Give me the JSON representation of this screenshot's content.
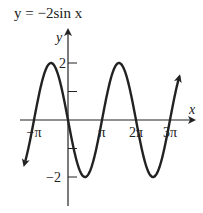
{
  "chart_data": {
    "type": "line",
    "title": "y = −2sin x",
    "function": "y = -2*sin(x)",
    "xlabel": "x",
    "ylabel": "y",
    "xlim": [
      -3.3,
      10.3
    ],
    "ylim": [
      -2.6,
      2.6
    ],
    "x_ticks": [
      {
        "value": -3.14159,
        "label": "−π"
      },
      {
        "value": 3.14159,
        "label": "π"
      },
      {
        "value": 6.28319,
        "label": "2π"
      },
      {
        "value": 9.42478,
        "label": "3π"
      }
    ],
    "y_ticks": [
      {
        "value": 2,
        "label": "2"
      },
      {
        "value": 1,
        "label": ""
      },
      {
        "value": -1,
        "label": ""
      },
      {
        "value": -2,
        "label": "−2"
      }
    ],
    "key_points": [
      {
        "x": -3.14159,
        "y": 0
      },
      {
        "x": -1.5708,
        "y": 2
      },
      {
        "x": 0,
        "y": 0
      },
      {
        "x": 1.5708,
        "y": -2
      },
      {
        "x": 3.14159,
        "y": 0
      },
      {
        "x": 4.71239,
        "y": 2
      },
      {
        "x": 6.28319,
        "y": 0
      },
      {
        "x": 7.85398,
        "y": -2
      },
      {
        "x": 9.42478,
        "y": 0
      }
    ],
    "amplitude": 2,
    "period": "2π",
    "arrows_on_curve_ends": true,
    "grid": false,
    "legend": null
  }
}
